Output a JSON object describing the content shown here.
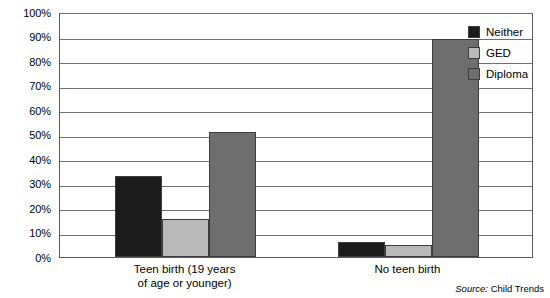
{
  "chart_data": {
    "type": "bar",
    "title": "",
    "subtitle": "",
    "xlabel": "",
    "ylabel": "",
    "ylim": [
      0,
      100
    ],
    "y_tick_labels": [
      "100%",
      "90%",
      "80%",
      "70%",
      "60%",
      "50%",
      "40%",
      "30%",
      "20%",
      "10%",
      "0%"
    ],
    "y_tick_values": [
      100,
      90,
      80,
      70,
      60,
      50,
      40,
      30,
      20,
      10,
      0
    ],
    "grid": true,
    "legend_position": "right-top",
    "categories": [
      "Teen birth (19 years of age or younger)",
      "No teen birth"
    ],
    "category_label_lines": [
      [
        "Teen birth (19 years",
        "of age or younger)"
      ],
      [
        "No teen birth"
      ]
    ],
    "series": [
      {
        "name": "Neither",
        "color": "#1c1c1c",
        "values": [
          33,
          6
        ]
      },
      {
        "name": "GED",
        "color": "#b9b9b9",
        "values": [
          15.5,
          5
        ]
      },
      {
        "name": "Diploma",
        "color": "#6e6e6e",
        "values": [
          51,
          89
        ]
      }
    ],
    "annotations": {
      "source": "Child Trends",
      "source_prefix": "Source:"
    }
  },
  "legend": {
    "items": [
      {
        "label": "Neither"
      },
      {
        "label": "GED"
      },
      {
        "label": "Diploma"
      }
    ]
  },
  "axis": {
    "y_labels": [
      "100%",
      "90%",
      "80%",
      "70%",
      "60%",
      "50%",
      "40%",
      "30%",
      "20%",
      "10%",
      "0%"
    ]
  },
  "footer": {
    "source_prefix": "Source:",
    "source_value": "Child Trends"
  }
}
